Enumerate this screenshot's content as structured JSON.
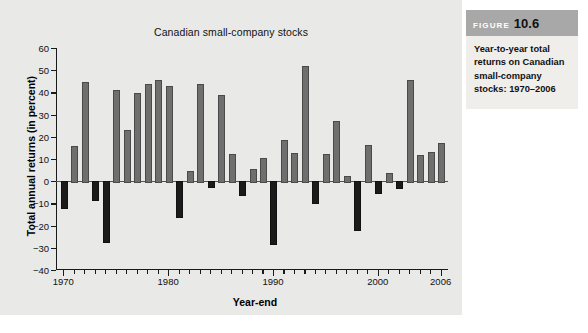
{
  "caption": {
    "figure_word": "FIGURE",
    "figure_number": "10.6",
    "body": "Year-to-year total returns on Canadian small-company stocks: 1970–2006"
  },
  "colors": {
    "panel_background": "#e9e9e7",
    "positive_bar": "#6f6f6f",
    "negative_bar": "#1b1b1b",
    "caption_header": "#a8a8a8",
    "caption_body_background": "#f0eeeb"
  },
  "chart_data": {
    "type": "bar",
    "title": "Canadian small-company stocks",
    "xlabel": "Year-end",
    "ylabel": "Total annual returns (in percent)",
    "ylim": [
      -40,
      60
    ],
    "yticks": [
      -40,
      -30,
      -20,
      -10,
      0,
      10,
      20,
      30,
      40,
      50,
      60
    ],
    "ytick_labels": [
      "−40",
      "−30",
      "−20",
      "−10",
      "0",
      "10",
      "20",
      "30",
      "40",
      "50",
      "60"
    ],
    "xlim": [
      1969.3,
      2006.7
    ],
    "xticks": [
      1970,
      1980,
      1990,
      2000,
      2006
    ],
    "xtick_labels": [
      "1970",
      "1980",
      "1990",
      "2000",
      "2006"
    ],
    "grid": false,
    "legend": null,
    "categories": [
      1970,
      1971,
      1972,
      1973,
      1974,
      1975,
      1976,
      1977,
      1978,
      1979,
      1980,
      1981,
      1982,
      1983,
      1984,
      1985,
      1986,
      1987,
      1988,
      1989,
      1990,
      1991,
      1992,
      1993,
      1994,
      1995,
      1996,
      1997,
      1998,
      1999,
      2000,
      2001,
      2002,
      2003,
      2004,
      2005,
      2006
    ],
    "values": [
      -11.5,
      16.0,
      44.5,
      -7.8,
      -27.0,
      41.0,
      23.0,
      39.7,
      44.0,
      45.8,
      43.0,
      -15.5,
      4.7,
      43.9,
      -2.0,
      38.8,
      12.3,
      -5.6,
      5.5,
      10.6,
      -27.8,
      18.4,
      12.8,
      51.8,
      -9.5,
      12.2,
      27.0,
      2.3,
      -21.7,
      16.2,
      -5.0,
      3.8,
      -2.6,
      45.8,
      11.9,
      13.2,
      17.0
    ]
  }
}
